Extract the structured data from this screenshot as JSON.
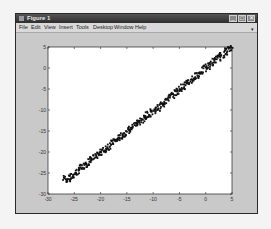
{
  "window": {
    "title": "Figure 1",
    "controls": {
      "minimize": "_",
      "maximize": "□",
      "close": "✕"
    },
    "menu": [
      "File",
      "Edit",
      "View",
      "Insert",
      "Tools",
      "Desktop",
      "Window",
      "Help"
    ],
    "dock_arrow": "▾"
  },
  "chart_data": {
    "type": "scatter",
    "title": "",
    "xlabel": "",
    "ylabel": "",
    "xlim": [
      -30,
      5
    ],
    "ylim": [
      -30,
      5
    ],
    "xticks": [
      -30,
      -25,
      -20,
      -15,
      -10,
      -5,
      0,
      5
    ],
    "yticks": [
      5,
      0,
      -5,
      -10,
      -15,
      -20,
      -25,
      -30
    ],
    "grid": false,
    "legend": null,
    "series": [
      {
        "name": "data",
        "color": "#111111",
        "description": "dense noisy near-linear band, y ≈ x",
        "x": [
          -27,
          -26,
          -25,
          -24,
          -23,
          -22,
          -21,
          -20,
          -19,
          -18,
          -17,
          -16,
          -15,
          -14,
          -13,
          -12,
          -11,
          -10,
          -9,
          -8,
          -7,
          -6,
          -5,
          -4,
          -3,
          -2,
          -1,
          0,
          1,
          2,
          3,
          4,
          5
        ],
        "y": [
          -26.2,
          -26.5,
          -25.3,
          -24.1,
          -23.2,
          -22.0,
          -21.2,
          -20.1,
          -19.3,
          -18.0,
          -17.1,
          -16.2,
          -15.1,
          -14.2,
          -13.0,
          -12.3,
          -11.1,
          -10.2,
          -9.4,
          -8.3,
          -7.0,
          -6.1,
          -5.0,
          -4.1,
          -3.2,
          -2.0,
          -1.1,
          0.1,
          1.0,
          2.1,
          3.0,
          4.1,
          5.0
        ]
      }
    ]
  }
}
